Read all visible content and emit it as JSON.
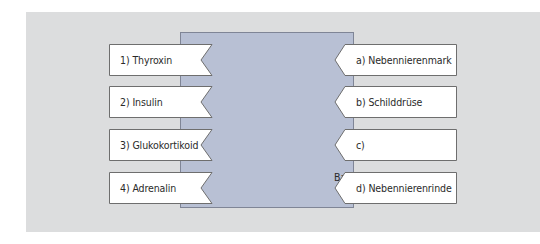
{
  "diagram": {
    "type": "matching-exercise",
    "colors": {
      "background_panel": "#dcddde",
      "center_box": "#b8c0d4",
      "label_fill": "#ffffff",
      "label_border": "#6e6e6e"
    },
    "left_items": [
      {
        "label": "1) Thyroxin"
      },
      {
        "label": "2) Insulin"
      },
      {
        "label": "3) Glukokortikoid"
      },
      {
        "label": "4) Adrenalin"
      }
    ],
    "right_items": [
      {
        "label": "a) Nebennierenmark"
      },
      {
        "label": "b) Schilddrüse"
      },
      {
        "label": "c) Bauchspeicheldrüse"
      },
      {
        "label": "d) Nebennierenrinde"
      }
    ]
  }
}
